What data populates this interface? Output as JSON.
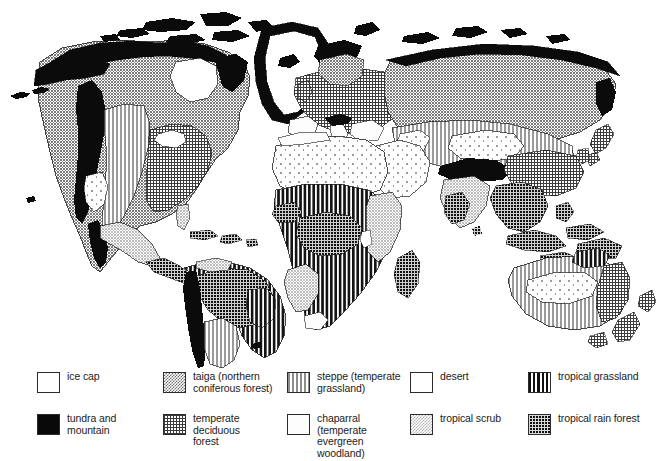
{
  "figure": {
    "kind": "thematic-world-map",
    "background_color": "#ffffff",
    "outline_color": "#1a1a1a"
  },
  "legend": {
    "columns": [
      {
        "left": 37,
        "width": 118,
        "items": [
          {
            "id": "ice-cap",
            "label": "ice cap",
            "swatch": "sw-ice",
            "pattern": "solid-white",
            "color": "#ffffff"
          },
          {
            "id": "tundra",
            "label": "tundra and\nmountain",
            "swatch": "sw-tundra",
            "pattern": "solid-black",
            "color": "#090909"
          }
        ]
      },
      {
        "left": 163,
        "width": 120,
        "items": [
          {
            "id": "taiga",
            "label": "taiga (northern\nconiferous forest)",
            "swatch": "sw-taiga",
            "pattern": "stipple-medium",
            "color": "#6f6f6f"
          },
          {
            "id": "deciduous",
            "label": "temperate deciduous\nforest",
            "swatch": "sw-deciduous",
            "pattern": "fine-grid",
            "color": "#3a3a3a"
          }
        ]
      },
      {
        "left": 287,
        "width": 120,
        "items": [
          {
            "id": "steppe",
            "label": "steppe (temperate\ngrassland)",
            "swatch": "sw-steppe",
            "pattern": "vertical-stripes-light",
            "color": "#8d8d8d"
          },
          {
            "id": "chaparral",
            "label": "chaparral (temperate\nevergreen woodland)",
            "swatch": "sw-chaparral",
            "pattern": "solid-white",
            "color": "#fdfdfd"
          }
        ]
      },
      {
        "left": 410,
        "width": 112,
        "items": [
          {
            "id": "desert",
            "label": "desert",
            "swatch": "sw-desert",
            "pattern": "solid-white",
            "color": "#ffffff"
          },
          {
            "id": "tropical-scrub",
            "label": "tropical scrub",
            "swatch": "sw-tscrub",
            "pattern": "stipple-light",
            "color": "#b4b4b4"
          }
        ]
      },
      {
        "left": 528,
        "width": 128,
        "items": [
          {
            "id": "tropical-grassland",
            "label": "tropical grassland",
            "swatch": "sw-tgrass",
            "pattern": "vertical-stripes-bold",
            "color": "#111111"
          },
          {
            "id": "tropical-rain-forest",
            "label": "tropical rain forest",
            "swatch": "sw-trainforest",
            "pattern": "grid-on-black",
            "color": "#101010"
          }
        ]
      }
    ]
  },
  "map_regions": [
    {
      "continent": "North America",
      "biomes": [
        "ice cap",
        "tundra and mountain",
        "taiga (northern coniferous forest)",
        "steppe (temperate grassland)",
        "temperate deciduous forest",
        "desert",
        "tropical scrub",
        "tropical rain forest"
      ]
    },
    {
      "continent": "South America",
      "biomes": [
        "tropical rain forest",
        "tropical grassland",
        "tundra and mountain",
        "steppe (temperate grassland)",
        "tropical scrub",
        "desert"
      ]
    },
    {
      "continent": "Europe",
      "biomes": [
        "tundra and mountain",
        "taiga (northern coniferous forest)",
        "temperate deciduous forest",
        "chaparral (temperate evergreen woodland)",
        "steppe (temperate grassland)"
      ]
    },
    {
      "continent": "Africa",
      "biomes": [
        "desert",
        "tropical grassland",
        "tropical rain forest",
        "tropical scrub",
        "chaparral (temperate evergreen woodland)"
      ]
    },
    {
      "continent": "Asia",
      "biomes": [
        "tundra and mountain",
        "taiga (northern coniferous forest)",
        "steppe (temperate grassland)",
        "desert",
        "temperate deciduous forest",
        "tropical rain forest",
        "tropical scrub"
      ]
    },
    {
      "continent": "Australia",
      "biomes": [
        "desert",
        "steppe (temperate grassland)",
        "tropical scrub",
        "temperate deciduous forest",
        "tropical grassland"
      ]
    },
    {
      "continent": "Greenland",
      "biomes": [
        "ice cap",
        "tundra and mountain"
      ]
    }
  ]
}
